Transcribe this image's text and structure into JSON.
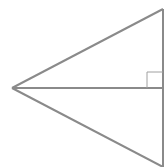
{
  "diagram": {
    "type": "geometry",
    "stroke_color": "#8a8a8a",
    "background": "#ffffff",
    "points": {
      "left_vertex": [
        12,
        88
      ],
      "top_vertex": [
        163,
        9
      ],
      "bottom_vertex": [
        163,
        167
      ],
      "foot": [
        163,
        88
      ]
    },
    "right_angle_marker": {
      "x": 147,
      "y": 72,
      "size": 16
    }
  }
}
